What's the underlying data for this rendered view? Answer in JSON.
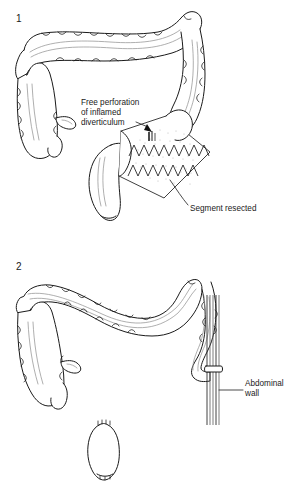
{
  "figure": {
    "background_color": "#ffffff",
    "line_color": "#1a1a1a",
    "shading_color": "#b9b9b9"
  },
  "panels": [
    {
      "number": "1",
      "caption_labels": [
        {
          "id": "free-perforation",
          "lines": [
            "Free perforation",
            "of inflamed",
            "diverticulum"
          ],
          "full_text": "Free perforation of inflamed diverticulum",
          "pointer": "arrow-down",
          "pointer_target": "perforation-site"
        },
        {
          "id": "segment-resected",
          "lines": [
            "Segment resected"
          ],
          "full_text": "Segment resected",
          "pointer": "curved-leader",
          "pointer_target": "resected-segment"
        }
      ],
      "anatomy": [
        "transverse-colon",
        "ascending-colon",
        "cecum",
        "terminal-ileum",
        "descending-colon",
        "sigmoid-colon",
        "rectum",
        "resected-segment"
      ]
    },
    {
      "number": "2",
      "caption_labels": [
        {
          "id": "abdominal-wall",
          "lines": [
            "Abdominal",
            "wall"
          ],
          "full_text": "Abdominal wall",
          "pointer": "straight-leader",
          "pointer_target": "abdominal-wall-layers"
        }
      ],
      "anatomy": [
        "transverse-colon",
        "ascending-colon",
        "cecum",
        "terminal-ileum",
        "descending-colon",
        "end-colostomy",
        "abdominal-wall-layers",
        "closed-rectal-stump"
      ]
    }
  ]
}
